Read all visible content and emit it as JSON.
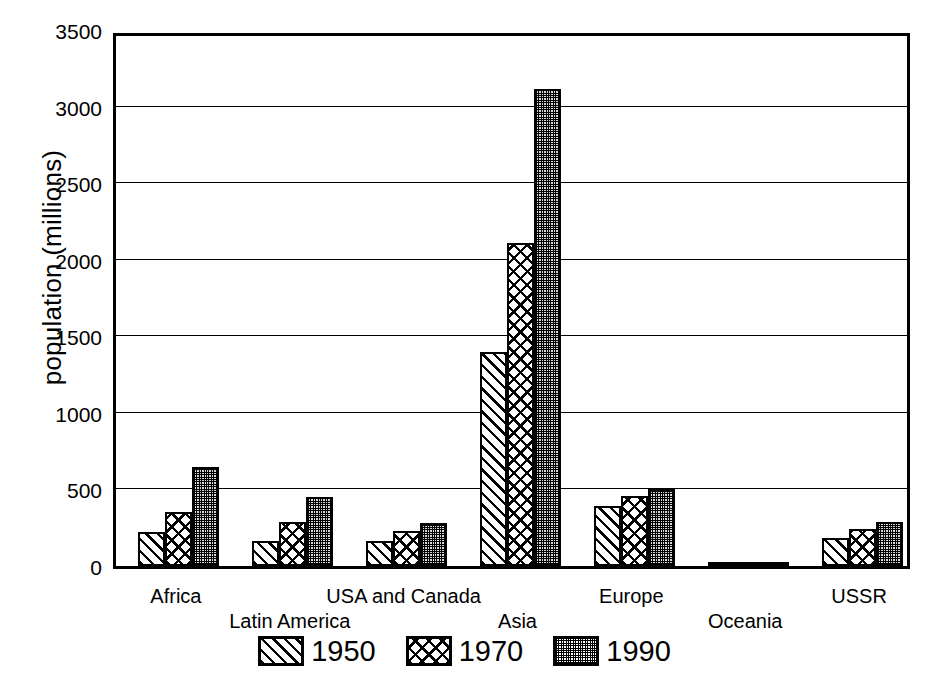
{
  "chart_data": {
    "type": "bar",
    "title": "",
    "xlabel": "",
    "ylabel": "population (millions)",
    "ylim": [
      0,
      3500
    ],
    "yticks": [
      0,
      500,
      1000,
      1500,
      2000,
      2500,
      3000,
      3500
    ],
    "ytick_labels": [
      "0",
      "500",
      "1000",
      "1500",
      "2000",
      "2500",
      "3000",
      "3500"
    ],
    "grid": true,
    "grid_axis": "y",
    "legend_position": "bottom",
    "categories": [
      "Africa",
      "Latin America",
      "USA and Canada",
      "Asia",
      "Europe",
      "Oceania",
      "USSR"
    ],
    "series": [
      {
        "name": "1950",
        "pattern": "diagonal-hatch",
        "color": "#000000",
        "values": [
          220,
          165,
          165,
          1400,
          395,
          10,
          180
        ]
      },
      {
        "name": "1970",
        "pattern": "cross-hatch",
        "color": "#000000",
        "values": [
          355,
          285,
          230,
          2110,
          460,
          20,
          240
        ]
      },
      {
        "name": "1990",
        "pattern": "stipple",
        "color": "#000000",
        "values": [
          645,
          450,
          280,
          3115,
          500,
          25,
          285
        ]
      }
    ]
  },
  "axis": {
    "y_title": "population (millions)"
  },
  "legend": {
    "items": [
      {
        "label": "1950",
        "pattern": "diagonal-hatch"
      },
      {
        "label": "1970",
        "pattern": "cross-hatch"
      },
      {
        "label": "1990",
        "pattern": "stipple"
      }
    ]
  }
}
